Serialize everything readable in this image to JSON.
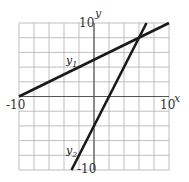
{
  "chart_data": {
    "type": "line",
    "title": "",
    "xlabel": "x",
    "ylabel": "y",
    "xlim": [
      -10,
      10
    ],
    "ylim": [
      -10,
      10
    ],
    "grid": true,
    "grid_step": 2,
    "tick_labels": {
      "x_min": "-10",
      "x_max": "10",
      "y_max": "10",
      "y_min": "-10"
    },
    "series": [
      {
        "name": "y1",
        "label_base": "y",
        "label_sub": "1",
        "equation": "y = 0.5x + 5",
        "x": [
          -10,
          10
        ],
        "y": [
          0,
          10
        ]
      },
      {
        "name": "y2",
        "label_base": "y",
        "label_sub": "2",
        "equation": "y = 2x - 4",
        "x": [
          -3,
          7
        ],
        "y": [
          -10,
          10
        ]
      }
    ],
    "intersection": {
      "x": 6,
      "y": 8
    },
    "legend": "inline labels"
  },
  "colors": {
    "grid": "#bfbfbf",
    "axis": "#555555",
    "line": "#1a1a1a"
  }
}
